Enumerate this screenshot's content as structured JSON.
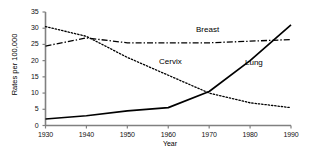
{
  "chart_data": {
    "type": "line",
    "title": "",
    "xlabel": "Year",
    "ylabel": "Rates per 100,000",
    "x": [
      1930,
      1940,
      1950,
      1960,
      1970,
      1980,
      1990
    ],
    "xlim": [
      1930,
      1990
    ],
    "ylim": [
      0,
      35
    ],
    "xticks": [
      "1930",
      "1940",
      "1950",
      "1960",
      "1970",
      "1980",
      "1990"
    ],
    "yticks": [
      "0",
      "5",
      "10",
      "15",
      "20",
      "25",
      "30",
      "35"
    ],
    "grid": false,
    "legend": "inline-annotations",
    "series": [
      {
        "name": "Cervix",
        "style": "dotted",
        "color": "#000000",
        "values": [
          30.5,
          27.5,
          21.0,
          15.5,
          10.0,
          7.0,
          5.5
        ]
      },
      {
        "name": "Breast",
        "style": "dash-dot",
        "color": "#000000",
        "values": [
          24.5,
          27.0,
          25.5,
          25.5,
          25.5,
          26.0,
          26.5
        ]
      },
      {
        "name": "Lung",
        "style": "solid",
        "color": "#000000",
        "values": [
          2.0,
          3.0,
          4.5,
          5.5,
          10.5,
          20.0,
          31.0
        ]
      }
    ],
    "annotations": [
      {
        "text": "Breast",
        "x": 1970,
        "y": 28.5
      },
      {
        "text": "Cervix",
        "x": 1960,
        "y": 18.0
      },
      {
        "text": "Lung",
        "x": 1981,
        "y": 18.0
      }
    ]
  }
}
